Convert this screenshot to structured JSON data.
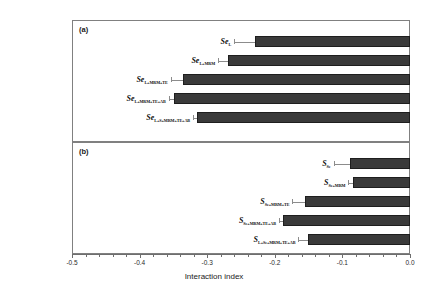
{
  "chart_data": {
    "type": "bar",
    "orientation": "horizontal",
    "title": "",
    "xlabel": "Interaction index",
    "ylabel": "",
    "xlim": [
      -0.5,
      0.0
    ],
    "xticks": [
      -0.5,
      -0.4,
      -0.3,
      -0.2,
      -0.1,
      0.0
    ],
    "xticklabels": [
      "-0.5",
      "-0.4",
      "-0.3",
      "-0.2",
      "-0.1",
      "0.0"
    ],
    "minor_ticks_per_interval": 4,
    "grid": false,
    "legend": false,
    "bar_color": "#3a3a3a",
    "bar_edge_color": "#1e1e1e",
    "error_bar_color": "#8c8c8c",
    "panels": [
      {
        "tag": "(a)",
        "categories": [
          {
            "base": "Se",
            "sub": "L"
          },
          {
            "base": "Se",
            "sub": "L+MRM"
          },
          {
            "base": "Se",
            "sub": "L+MRM+TE"
          },
          {
            "base": "Se",
            "sub": "L+MRM+TE+AB"
          },
          {
            "base": "Se",
            "sub": "L+S+MRM+TE+AB"
          }
        ],
        "values": [
          -0.229,
          -0.269,
          -0.336,
          -0.349,
          -0.315
        ],
        "errors": [
          0.031,
          0.015,
          0.018,
          0.008,
          0.006
        ]
      },
      {
        "tag": "(b)",
        "categories": [
          {
            "base": "S",
            "sub": "Se"
          },
          {
            "base": "S",
            "sub": "Se+MRM"
          },
          {
            "base": "S",
            "sub": "Se+MRM+TE"
          },
          {
            "base": "S",
            "sub": "Se+MRM+TE+AB"
          },
          {
            "base": "S",
            "sub": "L+Se+MRM+TE+AB"
          }
        ],
        "values": [
          -0.089,
          -0.084,
          -0.155,
          -0.188,
          -0.151
        ],
        "errors": [
          0.024,
          0.007,
          0.019,
          0.006,
          0.014
        ]
      }
    ]
  }
}
